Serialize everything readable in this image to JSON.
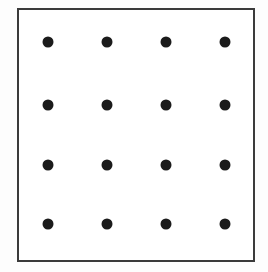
{
  "figure": {
    "canvas": {
      "width": 268,
      "height": 272,
      "background_color": "#fdfdfd"
    },
    "frame": {
      "name": "square-outline",
      "left": 17,
      "top": 8,
      "width": 238,
      "height": 254,
      "border_width": 2,
      "border_color": "#3b3b3b",
      "fill_color": "#ffffff"
    },
    "dots": {
      "shape": "circle",
      "fill_color": "#1b1b1b",
      "diameter": 11,
      "rows": 4,
      "columns": 4,
      "count": 16,
      "column_centers_x": [
        48,
        107,
        166,
        225
      ],
      "row_centers_y": [
        42,
        105,
        165,
        224
      ],
      "column_spacing": 59,
      "row_spacing": 60.7
    }
  },
  "chart_data": {
    "type": "scatter",
    "title": "",
    "subtitle": "",
    "xlabel": "",
    "ylabel": "",
    "grid": false,
    "legend": null,
    "annotations": [],
    "xticks": [],
    "yticks": [],
    "xlim": [
      17,
      255
    ],
    "ylim": [
      8,
      262
    ],
    "marker": {
      "style": "o",
      "color": "#1b1b1b",
      "size": 11
    },
    "series": [
      {
        "name": "dot-grid",
        "points": [
          {
            "x": 48,
            "y": 42
          },
          {
            "x": 107,
            "y": 42
          },
          {
            "x": 166,
            "y": 42
          },
          {
            "x": 225,
            "y": 42
          },
          {
            "x": 48,
            "y": 105
          },
          {
            "x": 107,
            "y": 105
          },
          {
            "x": 166,
            "y": 105
          },
          {
            "x": 225,
            "y": 105
          },
          {
            "x": 48,
            "y": 165
          },
          {
            "x": 107,
            "y": 165
          },
          {
            "x": 166,
            "y": 165
          },
          {
            "x": 225,
            "y": 165
          },
          {
            "x": 48,
            "y": 224
          },
          {
            "x": 107,
            "y": 224
          },
          {
            "x": 166,
            "y": 224
          },
          {
            "x": 225,
            "y": 224
          }
        ]
      }
    ]
  }
}
